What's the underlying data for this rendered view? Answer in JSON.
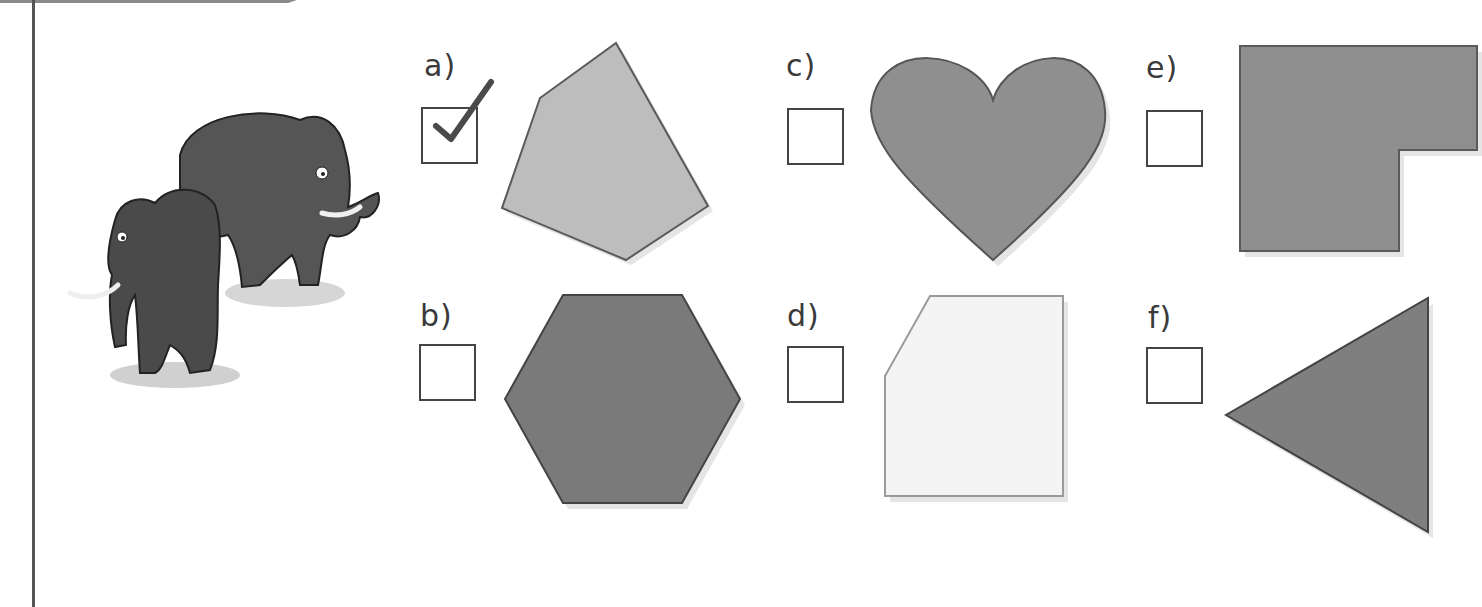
{
  "worksheet": {
    "illustration": {
      "subject": "two woolly mammoths",
      "icon": "mammoth-illustration"
    },
    "options": [
      {
        "id": "a",
        "label": "a)",
        "checked": true,
        "shape": "irregular pentagon",
        "fill": "#bdbdbd"
      },
      {
        "id": "b",
        "label": "b)",
        "checked": false,
        "shape": "hexagon",
        "fill": "#7a7a7a"
      },
      {
        "id": "c",
        "label": "c)",
        "checked": false,
        "shape": "heart",
        "fill": "#8f8f8f"
      },
      {
        "id": "d",
        "label": "d)",
        "checked": false,
        "shape": "irregular pentagon (cut-corner rectangle)",
        "fill": "#f4f4f4"
      },
      {
        "id": "e",
        "label": "e)",
        "checked": false,
        "shape": "L-shaped hexagon",
        "fill": "#8e8e8e"
      },
      {
        "id": "f",
        "label": "f)",
        "checked": false,
        "shape": "triangle",
        "fill": "#7f7f7f"
      }
    ],
    "colors": {
      "outline": "#5a5a5a",
      "checkmark": "#4a4a4a",
      "margin_line": "#555555"
    }
  }
}
